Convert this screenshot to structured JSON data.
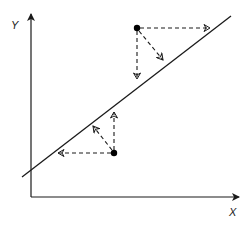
{
  "diagram": {
    "type": "regression-residual-illustration",
    "axes": {
      "x_label": "X",
      "y_label": "Y"
    },
    "colors": {
      "line": "#1a1a1a",
      "points": "#000000",
      "arrows": "#1a1a1a",
      "background": "#ffffff"
    },
    "regression_line": {
      "x1": 22,
      "y1": 177,
      "x2": 231,
      "y2": 16
    },
    "points": [
      {
        "name": "upper-point",
        "cx": 137,
        "cy": 28,
        "arrows": [
          {
            "name": "horizontal",
            "x2": 210,
            "y2": 28
          },
          {
            "name": "vertical",
            "x2": 137,
            "y2": 79
          },
          {
            "name": "perpendicular",
            "x2": 163,
            "y2": 60
          }
        ]
      },
      {
        "name": "lower-point",
        "cx": 114,
        "cy": 153,
        "arrows": [
          {
            "name": "horizontal",
            "x2": 58,
            "y2": 153
          },
          {
            "name": "vertical",
            "x2": 114,
            "y2": 112
          },
          {
            "name": "perpendicular",
            "x2": 93,
            "y2": 126
          }
        ]
      }
    ]
  }
}
